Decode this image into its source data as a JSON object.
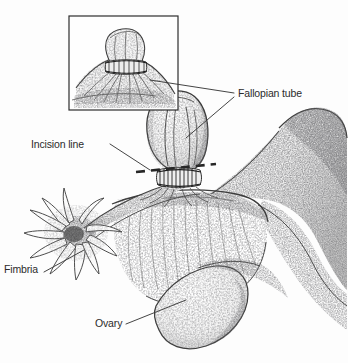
{
  "figure": {
    "background_color": "#fdfdfd",
    "ink_color": "#3a3a3a",
    "label_color": "#2b2b2b",
    "width": 348,
    "height": 363
  },
  "labels": [
    {
      "id": "fallopian-tube",
      "text": "Fallopian tube"
    },
    {
      "id": "incision-line",
      "text": "Incision line"
    },
    {
      "id": "fimbria",
      "text": "Fimbria"
    },
    {
      "id": "ovary",
      "text": "Ovary"
    }
  ],
  "inset": {
    "name": "magnified-ligature-inset",
    "box": {
      "x": 69,
      "y": 16,
      "width": 109,
      "height": 94
    },
    "content": "magnified ligated tube stump"
  },
  "annotations": {
    "incision_line_style": "dashed",
    "incision_line_color": "#2f2f2f",
    "leader_line_color": "#3a3a3a"
  }
}
